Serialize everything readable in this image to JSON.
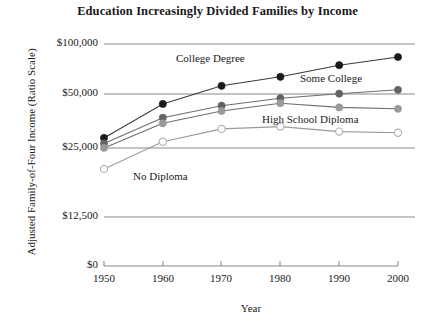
{
  "chart_data": {
    "type": "line",
    "title": "Education Increasingly Divided Families by Income",
    "xlabel": "Year",
    "ylabel": "Adjusted Family-of-Four Income (Ratio Scale)",
    "scale": "log",
    "grid": true,
    "legend_position": "inline-annotations",
    "x": [
      1950,
      1960,
      1970,
      1980,
      1990,
      2000
    ],
    "xtick_labels": [
      "1950",
      "1960",
      "1970",
      "1980",
      "1990",
      "2000"
    ],
    "ytick_values": [
      0,
      12500,
      25000,
      50000,
      100000
    ],
    "ytick_labels": [
      "$0",
      "$12,500",
      "$25,000",
      "$50,000",
      "$100,000"
    ],
    "ylim": [
      0,
      100000
    ],
    "series": [
      {
        "name": "College Degree",
        "marker": "filled-black",
        "color": "#1a1a1a",
        "values": [
          27200,
          43600,
          56000,
          63500,
          74500,
          83500
        ]
      },
      {
        "name": "Some College",
        "marker": "filled-dark-gray",
        "color": "#636363",
        "values": [
          25200,
          36000,
          42500,
          47200,
          50200,
          53000
        ]
      },
      {
        "name": "High School Diploma",
        "marker": "filled-gray",
        "color": "#9a9a9a",
        "values": [
          23700,
          33300,
          39500,
          44000,
          41500,
          40700
        ]
      },
      {
        "name": "No Diploma",
        "marker": "open-circle",
        "color": "#b5b5b5",
        "values": [
          17700,
          25800,
          30800,
          31800,
          29700,
          29200
        ]
      }
    ]
  }
}
